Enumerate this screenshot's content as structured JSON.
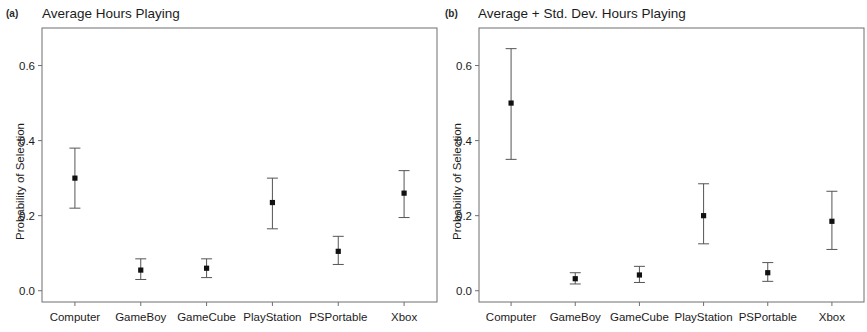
{
  "figure": {
    "background_color": "#ffffff",
    "axis_color": "#6f6f6f",
    "marker_color": "#111111",
    "errorbar_color": "#555555"
  },
  "panels": [
    {
      "letter": "(a)",
      "title": "Average Hours Playing",
      "ylabel": "Probability of Selection"
    },
    {
      "letter": "(b)",
      "title": "Average + Std. Dev. Hours Playing",
      "ylabel": "Probability of Selection"
    }
  ],
  "chart_data": [
    {
      "type": "scatter",
      "title": "Average Hours Playing",
      "panel": "(a)",
      "xlabel": "",
      "ylabel": "Probability of Selection",
      "categories": [
        "Computer",
        "GameBoy",
        "GameCube",
        "PlayStation",
        "PSPortable",
        "Xbox"
      ],
      "values": [
        0.3,
        0.055,
        0.06,
        0.235,
        0.105,
        0.26
      ],
      "error_low": [
        0.22,
        0.03,
        0.035,
        0.165,
        0.07,
        0.195
      ],
      "error_high": [
        0.38,
        0.085,
        0.085,
        0.3,
        0.145,
        0.32
      ],
      "yticks": [
        "0.0",
        "0.2",
        "0.4",
        "0.6"
      ],
      "ytick_values": [
        0.0,
        0.2,
        0.4,
        0.6
      ],
      "ylim": [
        -0.03,
        0.7
      ],
      "grid": false,
      "legend": "none"
    },
    {
      "type": "scatter",
      "title": "Average + Std. Dev. Hours Playing",
      "panel": "(b)",
      "xlabel": "",
      "ylabel": "Probability of Selection",
      "categories": [
        "Computer",
        "GameBoy",
        "GameCube",
        "PlayStation",
        "PSPortable",
        "Xbox"
      ],
      "values": [
        0.5,
        0.032,
        0.042,
        0.2,
        0.048,
        0.185
      ],
      "error_low": [
        0.35,
        0.018,
        0.022,
        0.125,
        0.025,
        0.11
      ],
      "error_high": [
        0.645,
        0.048,
        0.065,
        0.285,
        0.075,
        0.265
      ],
      "yticks": [
        "0.0",
        "0.2",
        "0.4",
        "0.6"
      ],
      "ytick_values": [
        0.0,
        0.2,
        0.4,
        0.6
      ],
      "ylim": [
        -0.03,
        0.7
      ],
      "grid": false,
      "legend": "none"
    }
  ]
}
